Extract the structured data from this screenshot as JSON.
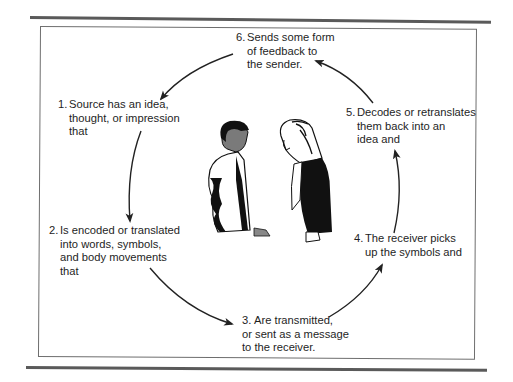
{
  "diagram": {
    "type": "cycle",
    "title": "",
    "steps": [
      {
        "number": "1.",
        "lines": [
          "Source has an idea,",
          "thought, or impression",
          "that"
        ]
      },
      {
        "number": "2.",
        "lines": [
          "Is encoded or translated",
          "into words, symbols,",
          "and body movements",
          "that"
        ]
      },
      {
        "number": "3.",
        "lines": [
          "Are transmitted,",
          "or sent as a message",
          "to the receiver."
        ]
      },
      {
        "number": "4.",
        "lines": [
          "The receiver picks",
          "up the symbols and"
        ]
      },
      {
        "number": "5.",
        "lines": [
          "Decodes or retranslates",
          "them back into an",
          "idea and"
        ]
      },
      {
        "number": "6.",
        "lines": [
          "Sends some form",
          "of feedback to",
          "the sender."
        ]
      }
    ],
    "center_image": "illustration of a man and a woman facing each other in conversation",
    "colors": {
      "text": "#1e1e1e",
      "arrows": "#222222",
      "frame": "#6e6e6e",
      "rules": "#5a5a5a"
    }
  }
}
